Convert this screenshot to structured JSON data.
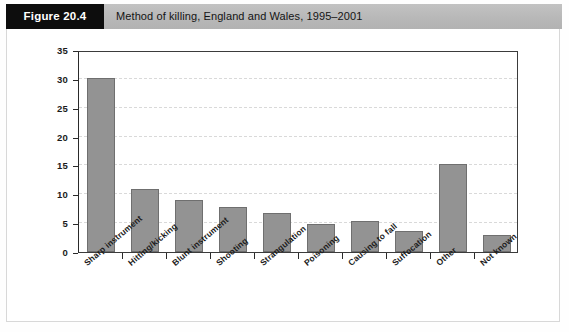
{
  "header": {
    "figure_tag": "Figure 20.4",
    "title": "Method of killing, England and Wales, 1995–2001"
  },
  "colors": {
    "bar_fill": "#939393",
    "bar_stroke": "#6f6f6f",
    "header_bar": "#bcbcbc",
    "tag_background": "#0d0d0d",
    "tag_text": "#ffffff",
    "axis": "#2a2a2a",
    "gridline": "#d9d9d9",
    "panel_border": "#d8d8d8"
  },
  "chart_data": {
    "type": "bar",
    "title": "Method of killing, England and Wales, 1995–2001",
    "xlabel": "",
    "ylabel": "",
    "ylim": [
      0,
      35
    ],
    "yticks": [
      0,
      5,
      10,
      15,
      20,
      25,
      30,
      35
    ],
    "ytick_labels": [
      "0",
      "5",
      "10",
      "15",
      "20",
      "25",
      "30",
      "35"
    ],
    "grid": true,
    "grid_axis": "y",
    "grid_style": "dashed",
    "legend": false,
    "categories": [
      "Sharp instrument",
      "Hitting/kicking",
      "Blunt instrument",
      "Shooting",
      "Strangulation",
      "Poisoning",
      "Causing to fall",
      "Suffocation",
      "Other",
      "Not known"
    ],
    "values": [
      30.1,
      10.9,
      9.0,
      7.8,
      6.7,
      4.9,
      5.3,
      3.6,
      15.3,
      3.0
    ],
    "tick_label_rotation": -40
  }
}
